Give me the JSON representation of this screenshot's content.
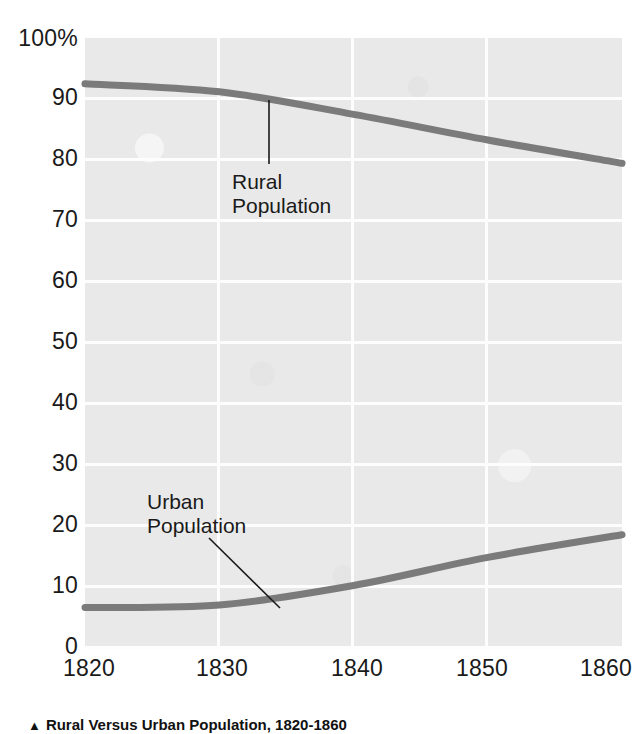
{
  "chart_data": {
    "type": "line",
    "title": "Rural Versus Urban Population, 1820-1860",
    "xlabel": "",
    "ylabel": "",
    "x": [
      1820,
      1830,
      1840,
      1850,
      1860
    ],
    "xlim": [
      1820,
      1860
    ],
    "ylim": [
      0,
      100
    ],
    "yticks": [
      0,
      10,
      20,
      30,
      40,
      50,
      60,
      70,
      80,
      90,
      100
    ],
    "ytick_labels": [
      "0",
      "10",
      "20",
      "30",
      "40",
      "50",
      "60",
      "70",
      "80",
      "90",
      "100%"
    ],
    "xtick_labels": [
      "1820",
      "1830",
      "1840",
      "1850",
      "1860"
    ],
    "grid": true,
    "legend": "inline-annotations",
    "series": [
      {
        "name": "Rural Population",
        "values": [
          92.5,
          91.2,
          87.5,
          83.3,
          79.5
        ],
        "color": "#7b7b7b"
      },
      {
        "name": "Urban Population",
        "values": [
          6.8,
          7.2,
          10.4,
          15.0,
          18.7
        ],
        "color": "#7b7b7b"
      }
    ],
    "annotations": [
      {
        "text": "Rural\nPopulation",
        "series": "Rural Population"
      },
      {
        "text": "Urban\nPopulation",
        "series": "Urban Population"
      }
    ],
    "plot_background": "#e9e9e9",
    "gridline_color": "#fdfdfd"
  },
  "axes": {
    "y_ticks": [
      {
        "label": "100%",
        "value": 100
      },
      {
        "label": "90",
        "value": 90
      },
      {
        "label": "80",
        "value": 80
      },
      {
        "label": "70",
        "value": 70
      },
      {
        "label": "60",
        "value": 60
      },
      {
        "label": "50",
        "value": 50
      },
      {
        "label": "40",
        "value": 40
      },
      {
        "label": "30",
        "value": 30
      },
      {
        "label": "20",
        "value": 20
      },
      {
        "label": "10",
        "value": 10
      },
      {
        "label": "0",
        "value": 0
      }
    ],
    "x_ticks": [
      {
        "label": "1820",
        "value": 1820
      },
      {
        "label": "1830",
        "value": 1830
      },
      {
        "label": "1840",
        "value": 1840
      },
      {
        "label": "1850",
        "value": 1850
      },
      {
        "label": "1860",
        "value": 1860
      }
    ]
  },
  "annotations": {
    "rural": "Rural\nPopulation",
    "urban": "Urban\nPopulation"
  },
  "caption": {
    "marker": "▲",
    "text": "Rural Versus Urban Population, 1820-1860"
  }
}
